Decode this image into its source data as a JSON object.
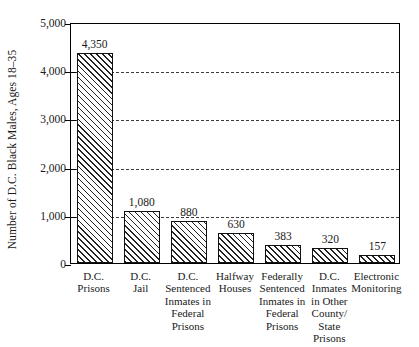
{
  "chart_data": {
    "type": "bar",
    "title": "",
    "xlabel": "",
    "ylabel": "Number of D.C. Black Males, Ages 18–35",
    "ylim": [
      0,
      5000
    ],
    "ytick_values": [
      5000,
      4000,
      3000,
      2000,
      1000,
      0
    ],
    "ytick_labels": [
      "5,000",
      "4,000",
      "3,000",
      "2,000",
      "1,000",
      "0"
    ],
    "gridlines_at": [
      4000,
      3000,
      2000,
      1000
    ],
    "grid": true,
    "legend": "none",
    "categories": [
      "D.C. Prisons",
      "D.C. Jail",
      "D.C. Sentenced Inmates in Federal Prisons",
      "Halfway Houses",
      "Federally Sentenced Inmates in Federal Prisons",
      "D.C. Inmates in Other County/ State Prisons",
      "Electronic Monitoring"
    ],
    "category_lines": [
      [
        "D.C.",
        "Prisons"
      ],
      [
        "D.C.",
        "Jail"
      ],
      [
        "D.C.",
        "Sentenced",
        "Inmates in",
        "Federal",
        "Prisons"
      ],
      [
        "Halfway",
        "Houses"
      ],
      [
        "Federally",
        "Sentenced",
        "Inmates in",
        "Federal",
        "Prisons"
      ],
      [
        "D.C.",
        "Inmates",
        "in Other",
        "County/",
        "State",
        "Prisons"
      ],
      [
        "Electronic",
        "Monitoring"
      ]
    ],
    "values": [
      4350,
      1080,
      880,
      630,
      383,
      320,
      157
    ],
    "value_labels": [
      "4,350",
      "1,080",
      "880",
      "630",
      "383",
      "320",
      "157"
    ],
    "bar_style": {
      "fill": "#ffffff",
      "hatch": "diagonal-45",
      "edge_color": "#111111"
    },
    "axis_color": "#000000",
    "grid_color": "#3a3a3a"
  }
}
